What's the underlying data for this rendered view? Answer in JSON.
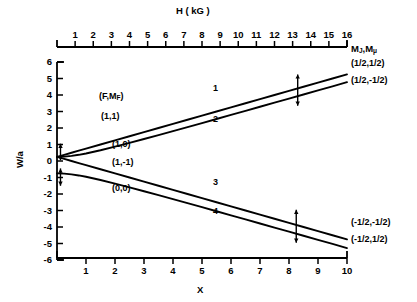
{
  "figure": {
    "kind": "breit-rabi-diagram",
    "top_axis": {
      "title": "H ( kG )",
      "title_plain": "H (kG)",
      "variable": "H",
      "unit": "kG",
      "ticks": [
        1,
        2,
        3,
        4,
        5,
        6,
        7,
        8,
        9,
        10,
        11,
        12,
        13,
        14,
        15,
        16
      ],
      "tick_labels": [
        "1",
        "2",
        "3",
        "4",
        "5",
        "6",
        "7",
        "8",
        "9",
        "10",
        "11",
        "12",
        "13",
        "14",
        "15",
        "16"
      ],
      "range": [
        0,
        16.0
      ]
    },
    "bottom_axis": {
      "title": "X",
      "ticks": [
        1,
        2,
        3,
        4,
        5,
        6,
        7,
        8,
        9,
        10
      ],
      "tick_labels": [
        "1",
        "2",
        "3",
        "4",
        "5",
        "6",
        "7",
        "8",
        "9",
        "10"
      ],
      "range": [
        0,
        10
      ]
    },
    "left_axis": {
      "title": "W/a",
      "ticks": [
        6,
        5,
        4,
        3,
        2,
        1,
        0,
        -1,
        -2,
        -3,
        -4,
        -5,
        -6
      ],
      "tick_labels": [
        "6",
        "5",
        "4",
        "3",
        "2",
        "1",
        "0",
        "-1",
        "-2",
        "-3",
        "-4",
        "-5",
        "-6"
      ],
      "range": [
        -6,
        6
      ]
    },
    "right_header": {
      "text": "MJ , Mμ",
      "m_j": "M",
      "sub_j": "J",
      "m_mu": "M",
      "sub_mu": "μ"
    },
    "interior_header": {
      "text": "( F , MF )",
      "f": "F",
      "m": "M",
      "sub": "F"
    },
    "interior_labels": [
      {
        "text": "(1,1)",
        "x": 1.25,
        "y": 3.0
      },
      {
        "text": "(1,0)",
        "x": 2.45,
        "y": -0.45
      },
      {
        "text": "(1,-1)",
        "x": 2.45,
        "y": -1.1
      },
      {
        "text": "(0,0)",
        "x": 2.45,
        "y": -2.3
      }
    ],
    "right_labels": [
      {
        "text": "(1/2,1/2)",
        "curve": 1
      },
      {
        "text": "(1/2,-1/2)",
        "curve": 2
      },
      {
        "text": "(-1/2,-1/2)",
        "curve": 3
      },
      {
        "text": "(-1/2,1/2)",
        "curve": 4
      }
    ],
    "curve_number_labels": [
      {
        "text": "1",
        "x": 5.6,
        "y": 3.55
      },
      {
        "text": "2",
        "x": 5.6,
        "y": 2.1
      },
      {
        "text": "3",
        "x": 5.6,
        "y": -2.4
      },
      {
        "text": "4",
        "x": 5.6,
        "y": -3.75
      }
    ],
    "arrow_markers": [
      {
        "name": "transition-arrow-upper",
        "x": 8.3,
        "y_top": 5.25,
        "y_bottom": 3.35
      },
      {
        "name": "transition-arrow-lower",
        "x": 8.25,
        "y_top": -2.95,
        "y_bottom": -4.95
      },
      {
        "name": "transition-arrow-origin-upper",
        "x": 0.12,
        "y_top": 1.05,
        "y_bottom": 0.05
      },
      {
        "name": "transition-arrow-origin-lower",
        "x": 0.12,
        "y_top": -0.45,
        "y_bottom": -1.5
      }
    ]
  },
  "chart_data": {
    "type": "line",
    "title": "",
    "xlabel": "X",
    "ylabel": "W/a",
    "xlim": [
      0,
      10
    ],
    "ylim": [
      -6,
      6
    ],
    "grid": false,
    "legend": "right-edge labels",
    "secondary_xaxis": {
      "label": "H ( kG )",
      "lim": [
        0,
        16.0
      ]
    },
    "x": [
      0,
      0.25,
      0.5,
      0.75,
      1,
      1.5,
      2,
      2.5,
      3,
      3.5,
      4,
      4.5,
      5,
      5.5,
      6,
      6.5,
      7,
      7.5,
      8,
      8.5,
      9,
      9.5,
      10
    ],
    "series": [
      {
        "name": "1",
        "state_FMF": "(1,1)",
        "state_MJMmu": "(1/2,1/2)",
        "formula": "W/a = 0.25 + 0.5*X",
        "values": [
          0.25,
          0.375,
          0.5,
          0.625,
          0.75,
          1.0,
          1.25,
          1.5,
          1.75,
          2.0,
          2.25,
          2.5,
          2.75,
          3.0,
          3.25,
          3.5,
          3.75,
          4.0,
          4.25,
          4.5,
          4.75,
          5.0,
          5.25
        ]
      },
      {
        "name": "2",
        "state_FMF": "(1,0)",
        "state_MJMmu": "(1/2,-1/2)",
        "formula": "W/a = -0.25 + 0.5*sqrt(1+X^2)",
        "values": [
          0.25,
          0.265,
          0.309,
          0.375,
          0.457,
          0.651,
          0.869,
          1.096,
          1.331,
          1.57,
          1.811,
          2.055,
          2.3,
          2.546,
          2.793,
          3.04,
          3.287,
          3.535,
          3.782,
          4.03,
          4.278,
          4.526,
          4.775
        ]
      },
      {
        "name": "3",
        "state_FMF": "(1,-1)",
        "state_MJMmu": "(-1/2,-1/2)",
        "formula": "W/a = 0.25 - 0.5*X",
        "values": [
          0.25,
          0.125,
          0.0,
          -0.125,
          -0.25,
          -0.5,
          -0.75,
          -1.0,
          -1.25,
          -1.5,
          -1.75,
          -2.0,
          -2.25,
          -2.5,
          -2.75,
          -3.0,
          -3.25,
          -3.5,
          -3.75,
          -4.0,
          -4.25,
          -4.5,
          -4.75
        ]
      },
      {
        "name": "4",
        "state_FMF": "(0,0)",
        "state_MJMmu": "(-1/2,1/2)",
        "formula": "W/a = -0.25 - 0.5*sqrt(1+X^2)",
        "values": [
          -0.75,
          -0.765,
          -0.809,
          -0.875,
          -0.957,
          -1.151,
          -1.369,
          -1.596,
          -1.831,
          -2.07,
          -2.311,
          -2.555,
          -2.8,
          -3.046,
          -3.293,
          -3.54,
          -3.787,
          -4.035,
          -4.282,
          -4.53,
          -4.778,
          -5.026,
          -5.275
        ]
      }
    ]
  }
}
